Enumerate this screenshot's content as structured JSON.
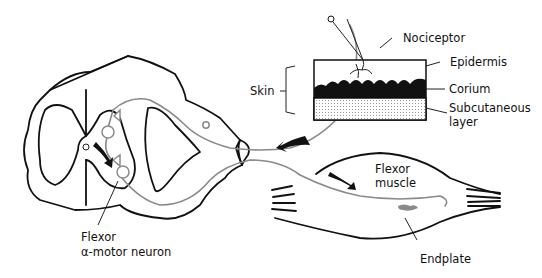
{
  "diagram": {
    "labels": {
      "nociceptor": "Nociceptor",
      "epidermis": "Epidermis",
      "corium": "Corium",
      "subcutaneous_1": "Subcutaneous",
      "subcutaneous_2": "layer",
      "skin": "Skin",
      "flexor_muscle_1": "Flexor",
      "flexor_muscle_2": "muscle",
      "endplate": "Endplate",
      "motor_neuron_1": "Flexor",
      "motor_neuron_2": "α-motor neuron"
    },
    "colors": {
      "outline": "#111111",
      "nerve_fiber": "#8a8a8a",
      "corium_fill": "#111111",
      "endplate": "#8a8a8a"
    },
    "components": [
      "spinal-cord-cross-section",
      "dorsal-root-ganglion",
      "afferent-fiber",
      "efferent-fiber",
      "skin-block",
      "flexor-muscle",
      "signal-arrows"
    ]
  }
}
